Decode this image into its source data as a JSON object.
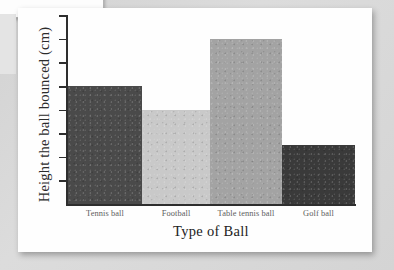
{
  "chart_data": {
    "type": "bar",
    "title": "",
    "xlabel": "Type of Ball",
    "ylabel": "Height the ball bounced (cm)",
    "categories": [
      "Tennis ball",
      "Football",
      "Table tennis ball",
      "Golf ball"
    ],
    "values": [
      5,
      4,
      7,
      2.5
    ],
    "ylim": [
      0,
      8
    ],
    "y_tick_count": 8,
    "y_tick_labels": [],
    "grid": false,
    "legend": false,
    "bar_colors": [
      "#4a4a4a",
      "#c9c9c9",
      "#a3a3a3",
      "#3a3a3a"
    ],
    "bar_widths_px": [
      74,
      68,
      72,
      73
    ]
  },
  "page": {
    "background_color": "#d8d8d8",
    "page_color": "#fefefe"
  }
}
